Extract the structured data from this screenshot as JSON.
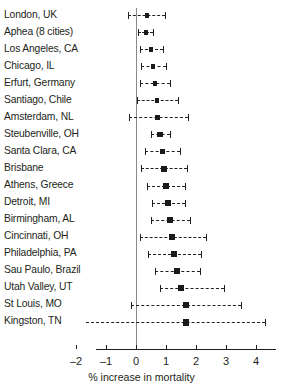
{
  "chart_data": {
    "type": "scatter",
    "title": "",
    "subtitle": "",
    "xlabel": "% increase in mortality",
    "ylabel": "",
    "xlim": [
      -2.1,
      4.1
    ],
    "xticks": [
      -2,
      -1,
      0,
      1,
      2,
      3,
      4
    ],
    "xticklabels": [
      "–2",
      "–1",
      "0",
      "1",
      "2",
      "3",
      "4"
    ],
    "grid": false,
    "legend": null,
    "reference_line": 0,
    "categories": [
      "London, UK",
      "Aphea (8 cities)",
      "Los Angeles, CA",
      "Chicago, IL",
      "Erfurt, Germany",
      "Santiago, Chile",
      "Amsterdam, NL",
      "Steubenville, OH",
      "Santa Clara, CA",
      "Brisbane",
      "Athens, Greece",
      "Detroit, MI",
      "Birmingham, AL",
      "Cincinnati, OH",
      "Philadelphia, PA",
      "Sau Paulo, Brazil",
      "Utah Valley, UT",
      "St Louis, MO",
      "Kingston, TN"
    ],
    "values": [
      0.37,
      0.33,
      0.5,
      0.57,
      0.63,
      0.7,
      0.73,
      0.8,
      0.87,
      0.93,
      1.0,
      1.07,
      1.13,
      1.2,
      1.27,
      1.37,
      1.5,
      1.67,
      1.67
    ],
    "ci_low": [
      -0.27,
      0.07,
      0.13,
      0.17,
      0.13,
      0.03,
      -0.23,
      0.5,
      0.3,
      0.17,
      0.37,
      0.53,
      0.5,
      0.13,
      0.4,
      0.63,
      0.8,
      -0.17,
      -2.3
    ],
    "ci_high": [
      0.97,
      0.57,
      0.9,
      1.0,
      1.13,
      1.4,
      1.73,
      1.13,
      1.47,
      1.7,
      1.63,
      1.63,
      1.8,
      2.33,
      2.17,
      2.13,
      2.93,
      3.5,
      4.3
    ],
    "series": [
      {
        "name": "% increase in mortality per 10 µg/m3",
        "points": [
          {
            "label": "London, UK",
            "value": 0.37,
            "ci": [
              -0.27,
              0.97
            ]
          },
          {
            "label": "Aphea (8 cities)",
            "value": 0.33,
            "ci": [
              0.07,
              0.57
            ]
          },
          {
            "label": "Los Angeles, CA",
            "value": 0.5,
            "ci": [
              0.13,
              0.9
            ]
          },
          {
            "label": "Chicago, IL",
            "value": 0.57,
            "ci": [
              0.17,
              1.0
            ]
          },
          {
            "label": "Erfurt, Germany",
            "value": 0.63,
            "ci": [
              0.13,
              1.13
            ]
          },
          {
            "label": "Santiago, Chile",
            "value": 0.7,
            "ci": [
              0.03,
              1.4
            ]
          },
          {
            "label": "Amsterdam, NL",
            "value": 0.73,
            "ci": [
              -0.23,
              1.73
            ]
          },
          {
            "label": "Steubenville, OH",
            "value": 0.8,
            "ci": [
              0.5,
              1.13
            ]
          },
          {
            "label": "Santa Clara, CA",
            "value": 0.87,
            "ci": [
              0.3,
              1.47
            ]
          },
          {
            "label": "Brisbane",
            "value": 0.93,
            "ci": [
              0.17,
              1.7
            ]
          },
          {
            "label": "Athens, Greece",
            "value": 1.0,
            "ci": [
              0.37,
              1.63
            ]
          },
          {
            "label": "Detroit, MI",
            "value": 1.07,
            "ci": [
              0.53,
              1.63
            ]
          },
          {
            "label": "Birmingham, AL",
            "value": 1.13,
            "ci": [
              0.5,
              1.8
            ]
          },
          {
            "label": "Cincinnati, OH",
            "value": 1.2,
            "ci": [
              0.13,
              2.33
            ]
          },
          {
            "label": "Philadelphia, PA",
            "value": 1.27,
            "ci": [
              0.4,
              2.17
            ]
          },
          {
            "label": "Sau Paulo, Brazil",
            "value": 1.37,
            "ci": [
              0.63,
              2.13
            ]
          },
          {
            "label": "Utah Valley, UT",
            "value": 1.5,
            "ci": [
              0.8,
              2.93
            ]
          },
          {
            "label": "St Louis, MO",
            "value": 1.67,
            "ci": [
              -0.17,
              3.5
            ]
          },
          {
            "label": "Kingston, TN",
            "value": 1.67,
            "ci": [
              -2.3,
              4.3
            ]
          }
        ]
      }
    ]
  },
  "axis": {
    "xlabel": "% increase in mortality",
    "ticklabels": [
      "–2",
      "–1",
      "0",
      "1",
      "2",
      "3",
      "4"
    ]
  },
  "colors": {
    "marker": "#1a1a1a",
    "ci_line": "#231f20",
    "reference_line": "#8a8a8a",
    "axis": "#231f20",
    "text": "#231f20",
    "background": "#ffffff"
  }
}
